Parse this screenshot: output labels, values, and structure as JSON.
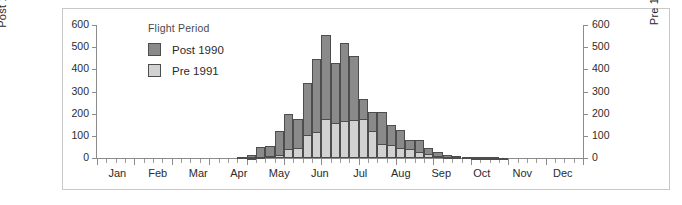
{
  "chart_data": {
    "type": "bar",
    "title": "",
    "subtitle": "",
    "legend_title": "Flight Period",
    "legend_position": "inside-top-left",
    "grid": false,
    "xlabel": "",
    "ylabel": "Post 1990",
    "y2label": "Pre 1991",
    "ylim": [
      0,
      600
    ],
    "y2lim": [
      0,
      600
    ],
    "ytick_labels": [
      "600",
      "500",
      "400",
      "300",
      "200",
      "100",
      "0"
    ],
    "ytick_values": [
      600,
      500,
      400,
      300,
      200,
      100,
      0
    ],
    "y2tick_labels": [
      "600",
      "500",
      "400",
      "300",
      "200",
      "100",
      "0"
    ],
    "y2tick_values": [
      600,
      500,
      400,
      300,
      200,
      100,
      0
    ],
    "xtick_labels": [
      "Jan",
      "Feb",
      "Mar",
      "Apr",
      "May",
      "Jun",
      "Jul",
      "Aug",
      "Sep",
      "Oct",
      "Nov",
      "Dec"
    ],
    "bin": "week",
    "n_bins": 52,
    "series": [
      {
        "name": "Post 1990",
        "color": "#8a8a8a",
        "axis": "left",
        "values": [
          0,
          0,
          0,
          0,
          0,
          0,
          0,
          0,
          0,
          0,
          0,
          0,
          0,
          0,
          0,
          5,
          12,
          48,
          53,
          122,
          200,
          175,
          340,
          445,
          553,
          430,
          520,
          458,
          268,
          207,
          207,
          150,
          125,
          80,
          80,
          45,
          28,
          12,
          10,
          6,
          5,
          3,
          3,
          2,
          0,
          0,
          0,
          0,
          0,
          0,
          0,
          0
        ]
      },
      {
        "name": "Pre 1991",
        "color": "#d2d2d2",
        "axis": "right",
        "values": [
          0,
          0,
          0,
          0,
          0,
          0,
          0,
          0,
          0,
          0,
          0,
          0,
          0,
          0,
          0,
          0,
          2,
          5,
          10,
          12,
          40,
          45,
          105,
          118,
          175,
          160,
          165,
          170,
          175,
          120,
          65,
          60,
          45,
          40,
          25,
          18,
          10,
          5,
          4,
          3,
          2,
          1,
          1,
          0,
          0,
          0,
          0,
          0,
          0,
          0,
          0,
          0
        ]
      }
    ]
  },
  "axes": {
    "left_title": "Post 1990",
    "right_title": "Pre 1991"
  },
  "legend": {
    "title": "Flight Period",
    "items": [
      {
        "label": "Post 1990",
        "color": "#8a8a8a",
        "swatch": "post"
      },
      {
        "label": "Pre 1991",
        "color": "#d2d2d2",
        "swatch": "pre"
      }
    ]
  },
  "colors": {
    "post_1990": "#8a8a8a",
    "pre_1991": "#d2d2d2",
    "axis": "#8c8c8c",
    "frame": "#c9c9c9",
    "text": "#2b2b2b",
    "background": "#ffffff"
  }
}
